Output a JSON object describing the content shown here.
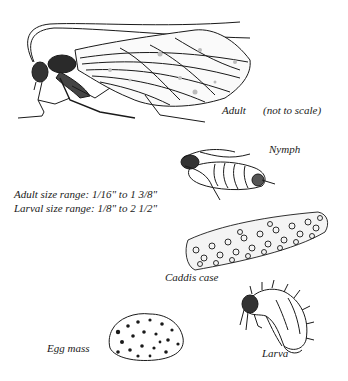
{
  "figure": {
    "adult": {
      "label": "Adult",
      "note": "(not to scale)"
    },
    "nymph": {
      "label": "Nymph"
    },
    "size_ranges": {
      "adult": "Adult size range: 1/16\" to 1 3/8\"",
      "larval": "Larval size range: 1/8\" to 2 1/2\""
    },
    "caddis_case": {
      "label": "Caddis case"
    },
    "egg_mass": {
      "label": "Egg mass"
    },
    "larva": {
      "label": "Larva"
    }
  },
  "colors": {
    "ink": "#1a1a1a",
    "paper": "#ffffff"
  }
}
